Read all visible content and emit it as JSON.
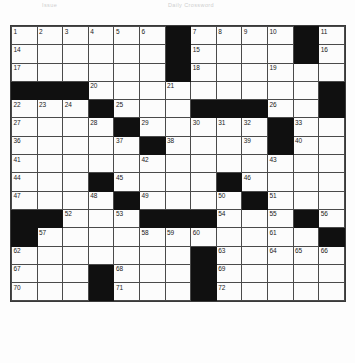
{
  "header": {
    "left_text": "Issue",
    "right_text": "Daily Crossword"
  },
  "puzzle": {
    "title": "Crossword Puzzle Grid",
    "columns": 13,
    "rows": 17,
    "block_color": "#101010",
    "cell_color": "#fcfcfc",
    "grid_line_color": "#4a4a4a",
    "number_color": "#1a1a1a",
    "highest_number": 72
  },
  "chart_data": {
    "type": "table",
    "columns": 13,
    "rows": 17,
    "legend": [
      "open cell",
      "block"
    ],
    "cells": [
      [
        {
          "b": false,
          "n": "1"
        },
        {
          "b": false,
          "n": "2"
        },
        {
          "b": false,
          "n": "3"
        },
        {
          "b": false,
          "n": "4"
        },
        {
          "b": false,
          "n": "5"
        },
        {
          "b": false,
          "n": "6"
        },
        {
          "b": true,
          "n": ""
        },
        {
          "b": false,
          "n": "7"
        },
        {
          "b": false,
          "n": "8"
        },
        {
          "b": false,
          "n": "9"
        },
        {
          "b": false,
          "n": "10"
        },
        {
          "b": true,
          "n": ""
        },
        {
          "b": false,
          "n": "11"
        }
      ],
      [
        {
          "b": false,
          "n": "14"
        },
        {
          "b": false,
          "n": ""
        },
        {
          "b": false,
          "n": ""
        },
        {
          "b": false,
          "n": ""
        },
        {
          "b": false,
          "n": ""
        },
        {
          "b": false,
          "n": ""
        },
        {
          "b": true,
          "n": ""
        },
        {
          "b": false,
          "n": "15"
        },
        {
          "b": false,
          "n": ""
        },
        {
          "b": false,
          "n": ""
        },
        {
          "b": false,
          "n": ""
        },
        {
          "b": true,
          "n": ""
        },
        {
          "b": false,
          "n": "16"
        }
      ],
      [
        {
          "b": false,
          "n": "17"
        },
        {
          "b": false,
          "n": ""
        },
        {
          "b": false,
          "n": ""
        },
        {
          "b": false,
          "n": ""
        },
        {
          "b": false,
          "n": ""
        },
        {
          "b": false,
          "n": ""
        },
        {
          "b": true,
          "n": ""
        },
        {
          "b": false,
          "n": "18"
        },
        {
          "b": false,
          "n": ""
        },
        {
          "b": false,
          "n": ""
        },
        {
          "b": false,
          "n": "19"
        },
        {
          "b": false,
          "n": ""
        },
        {
          "b": false,
          "n": ""
        }
      ],
      [
        {
          "b": true,
          "n": ""
        },
        {
          "b": true,
          "n": ""
        },
        {
          "b": true,
          "n": ""
        },
        {
          "b": false,
          "n": "20"
        },
        {
          "b": false,
          "n": ""
        },
        {
          "b": false,
          "n": ""
        },
        {
          "b": false,
          "n": "21"
        },
        {
          "b": false,
          "n": ""
        },
        {
          "b": false,
          "n": ""
        },
        {
          "b": false,
          "n": ""
        },
        {
          "b": false,
          "n": ""
        },
        {
          "b": false,
          "n": ""
        },
        {
          "b": true,
          "n": ""
        }
      ],
      [
        {
          "b": false,
          "n": "22"
        },
        {
          "b": false,
          "n": "23"
        },
        {
          "b": false,
          "n": "24"
        },
        {
          "b": true,
          "n": ""
        },
        {
          "b": false,
          "n": "25"
        },
        {
          "b": false,
          "n": ""
        },
        {
          "b": false,
          "n": ""
        },
        {
          "b": true,
          "n": ""
        },
        {
          "b": true,
          "n": ""
        },
        {
          "b": true,
          "n": ""
        },
        {
          "b": false,
          "n": "26"
        },
        {
          "b": false,
          "n": ""
        },
        {
          "b": true,
          "n": ""
        }
      ],
      [
        {
          "b": false,
          "n": "27"
        },
        {
          "b": false,
          "n": ""
        },
        {
          "b": false,
          "n": ""
        },
        {
          "b": false,
          "n": "28"
        },
        {
          "b": true,
          "n": ""
        },
        {
          "b": false,
          "n": "29"
        },
        {
          "b": false,
          "n": ""
        },
        {
          "b": false,
          "n": "30"
        },
        {
          "b": false,
          "n": "31"
        },
        {
          "b": false,
          "n": "32"
        },
        {
          "b": true,
          "n": ""
        },
        {
          "b": false,
          "n": "33"
        },
        {
          "b": false,
          "n": ""
        }
      ],
      [
        {
          "b": false,
          "n": "36"
        },
        {
          "b": false,
          "n": ""
        },
        {
          "b": false,
          "n": ""
        },
        {
          "b": false,
          "n": ""
        },
        {
          "b": false,
          "n": "37"
        },
        {
          "b": true,
          "n": ""
        },
        {
          "b": false,
          "n": "38"
        },
        {
          "b": false,
          "n": ""
        },
        {
          "b": false,
          "n": ""
        },
        {
          "b": false,
          "n": "39"
        },
        {
          "b": true,
          "n": ""
        },
        {
          "b": false,
          "n": "40"
        },
        {
          "b": false,
          "n": ""
        }
      ],
      [
        {
          "b": false,
          "n": "41"
        },
        {
          "b": false,
          "n": ""
        },
        {
          "b": false,
          "n": ""
        },
        {
          "b": false,
          "n": ""
        },
        {
          "b": false,
          "n": ""
        },
        {
          "b": false,
          "n": "42"
        },
        {
          "b": false,
          "n": ""
        },
        {
          "b": false,
          "n": ""
        },
        {
          "b": false,
          "n": ""
        },
        {
          "b": false,
          "n": ""
        },
        {
          "b": false,
          "n": "43"
        },
        {
          "b": false,
          "n": ""
        },
        {
          "b": false,
          "n": ""
        }
      ],
      [
        {
          "b": false,
          "n": "44"
        },
        {
          "b": false,
          "n": ""
        },
        {
          "b": false,
          "n": ""
        },
        {
          "b": true,
          "n": ""
        },
        {
          "b": false,
          "n": "45"
        },
        {
          "b": false,
          "n": ""
        },
        {
          "b": false,
          "n": ""
        },
        {
          "b": false,
          "n": ""
        },
        {
          "b": true,
          "n": ""
        },
        {
          "b": false,
          "n": "46"
        },
        {
          "b": false,
          "n": ""
        },
        {
          "b": false,
          "n": ""
        },
        {
          "b": false,
          "n": ""
        }
      ],
      [
        {
          "b": false,
          "n": "47"
        },
        {
          "b": false,
          "n": ""
        },
        {
          "b": false,
          "n": ""
        },
        {
          "b": false,
          "n": "48"
        },
        {
          "b": true,
          "n": ""
        },
        {
          "b": false,
          "n": "49"
        },
        {
          "b": false,
          "n": ""
        },
        {
          "b": false,
          "n": ""
        },
        {
          "b": false,
          "n": "50"
        },
        {
          "b": true,
          "n": ""
        },
        {
          "b": false,
          "n": "51"
        },
        {
          "b": false,
          "n": ""
        },
        {
          "b": false,
          "n": ""
        }
      ],
      [
        {
          "b": true,
          "n": ""
        },
        {
          "b": true,
          "n": ""
        },
        {
          "b": false,
          "n": "52"
        },
        {
          "b": false,
          "n": ""
        },
        {
          "b": false,
          "n": "53"
        },
        {
          "b": true,
          "n": ""
        },
        {
          "b": true,
          "n": ""
        },
        {
          "b": true,
          "n": ""
        },
        {
          "b": false,
          "n": "54"
        },
        {
          "b": false,
          "n": ""
        },
        {
          "b": false,
          "n": "55"
        },
        {
          "b": true,
          "n": ""
        },
        {
          "b": false,
          "n": "56"
        }
      ],
      [
        {
          "b": true,
          "n": ""
        },
        {
          "b": false,
          "n": "57"
        },
        {
          "b": false,
          "n": ""
        },
        {
          "b": false,
          "n": ""
        },
        {
          "b": false,
          "n": ""
        },
        {
          "b": false,
          "n": "58"
        },
        {
          "b": false,
          "n": "59"
        },
        {
          "b": false,
          "n": "60"
        },
        {
          "b": false,
          "n": ""
        },
        {
          "b": false,
          "n": ""
        },
        {
          "b": false,
          "n": "61"
        },
        {
          "b": false,
          "n": ""
        },
        {
          "b": true,
          "n": ""
        }
      ],
      [
        {
          "b": false,
          "n": "62"
        },
        {
          "b": false,
          "n": ""
        },
        {
          "b": false,
          "n": ""
        },
        {
          "b": false,
          "n": ""
        },
        {
          "b": false,
          "n": ""
        },
        {
          "b": false,
          "n": ""
        },
        {
          "b": false,
          "n": ""
        },
        {
          "b": true,
          "n": ""
        },
        {
          "b": false,
          "n": "63"
        },
        {
          "b": false,
          "n": ""
        },
        {
          "b": false,
          "n": "64"
        },
        {
          "b": false,
          "n": "65"
        },
        {
          "b": false,
          "n": "66"
        }
      ],
      [
        {
          "b": false,
          "n": "67"
        },
        {
          "b": false,
          "n": ""
        },
        {
          "b": false,
          "n": ""
        },
        {
          "b": true,
          "n": ""
        },
        {
          "b": false,
          "n": "68"
        },
        {
          "b": false,
          "n": ""
        },
        {
          "b": false,
          "n": ""
        },
        {
          "b": true,
          "n": ""
        },
        {
          "b": false,
          "n": "69"
        },
        {
          "b": false,
          "n": ""
        },
        {
          "b": false,
          "n": ""
        },
        {
          "b": false,
          "n": ""
        },
        {
          "b": false,
          "n": ""
        }
      ],
      [
        {
          "b": false,
          "n": "70"
        },
        {
          "b": false,
          "n": ""
        },
        {
          "b": false,
          "n": ""
        },
        {
          "b": true,
          "n": ""
        },
        {
          "b": false,
          "n": "71"
        },
        {
          "b": false,
          "n": ""
        },
        {
          "b": false,
          "n": ""
        },
        {
          "b": true,
          "n": ""
        },
        {
          "b": false,
          "n": "72"
        },
        {
          "b": false,
          "n": ""
        },
        {
          "b": false,
          "n": ""
        },
        {
          "b": false,
          "n": ""
        },
        {
          "b": false,
          "n": ""
        }
      ]
    ],
    "extra_columns": {
      "note": "rows 1-3 and 5-10 extend to 13 columns; numbers 12,13,34,35 appear in far-right columns",
      "row1_right": [
        "12",
        "13"
      ],
      "row2_right": [
        "",
        ""
      ],
      "row6_right": [
        "34",
        "35"
      ]
    }
  }
}
